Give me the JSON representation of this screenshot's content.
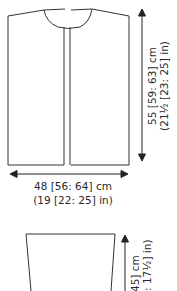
{
  "body_piece": {
    "length": {
      "cm": "55 [59: 63] cm",
      "in": "(21½ [23: 25] in)"
    },
    "width": {
      "cm": "48 [56: 64] cm",
      "in": "(19 [22: 25] in)"
    }
  },
  "sleeve_piece": {
    "length": {
      "cm": "45] cm",
      "in": ": 17½] in)"
    }
  },
  "colors": {
    "line": "#333333",
    "text": "#2a2a2a"
  }
}
